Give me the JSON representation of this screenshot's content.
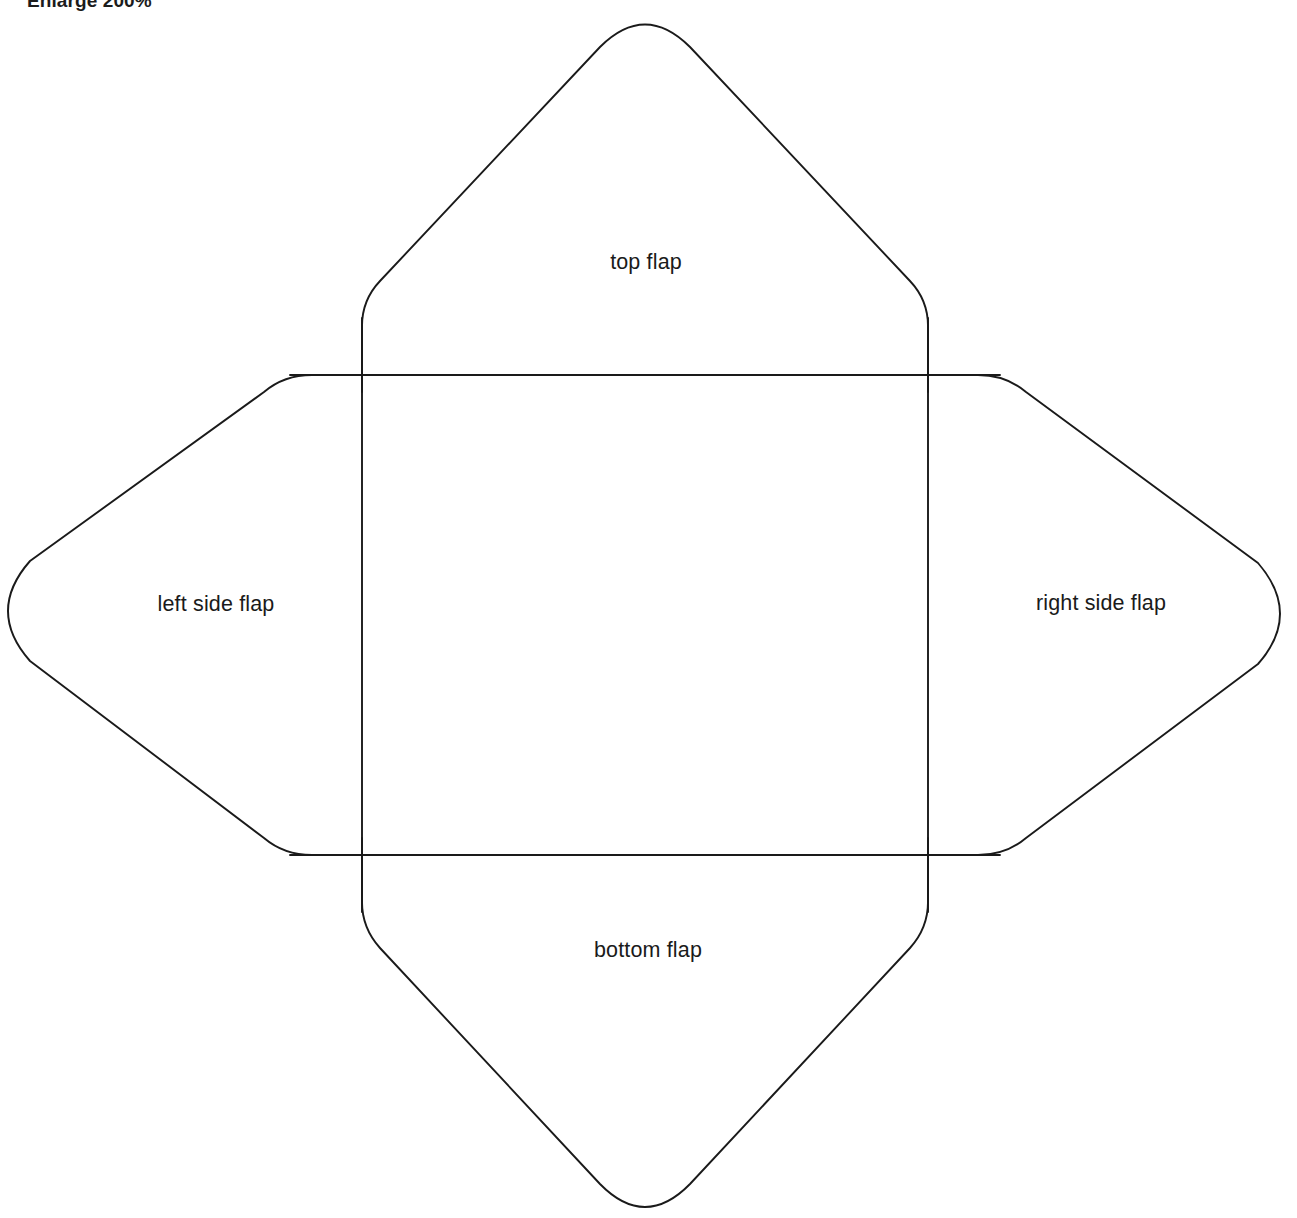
{
  "document": {
    "title": "Envelope Template",
    "instruction": "Enlarge 200%",
    "background_color": "#ffffff",
    "line_color": "#1a1a1a",
    "text_color": "#1a1a1a"
  },
  "labels": {
    "top_flap": "top flap",
    "left_side_flap": "left side flap",
    "right_side_flap": "right side flap",
    "bottom_flap": "bottom flap"
  },
  "geometry": {
    "stroke_width": 1.9,
    "center_panel": {
      "left": 362,
      "top": 375,
      "right": 927,
      "bottom": 855
    },
    "apexes": {
      "top": {
        "x": 645,
        "y": 27
      },
      "bottom": {
        "x": 645,
        "y": 1205
      },
      "left": {
        "x": 3,
        "y": 611
      },
      "right": {
        "x": 1285,
        "y": 614
      }
    },
    "corner_radius": 48
  }
}
